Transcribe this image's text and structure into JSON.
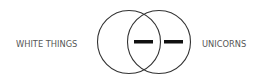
{
  "diagram": {
    "type": "venn",
    "sets": [
      {
        "label": "WHITE THINGS",
        "side": "left"
      },
      {
        "label": "UNICORNS",
        "side": "right"
      }
    ],
    "regions": [
      {
        "region": "intersection",
        "symbol": "dash"
      },
      {
        "region": "right-only",
        "symbol": "dash"
      }
    ],
    "colors": {
      "stroke": "#333333",
      "text": "#555555",
      "mark": "#111111"
    }
  }
}
